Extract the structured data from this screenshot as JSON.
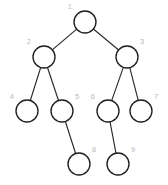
{
  "figure": {
    "type": "node-link-diagram",
    "canvas": {
      "width": 168,
      "height": 185,
      "background": "#ffffff"
    },
    "style": {
      "node_fill": "#ffffff",
      "node_stroke": "#1f1f1f",
      "node_radius": 11,
      "edge_color": "#2b2b2b",
      "label_color": "#b9b9b9",
      "label_font_size": 7.5
    },
    "nodes": [
      {
        "id": "1",
        "label": "1",
        "cx": 85,
        "cy": 22,
        "r": 11,
        "label_x": 72,
        "label_y": 7,
        "label_side": "left"
      },
      {
        "id": "2",
        "label": "2",
        "cx": 44,
        "cy": 57,
        "r": 11,
        "label_x": 31,
        "label_y": 42,
        "label_side": "left"
      },
      {
        "id": "3",
        "label": "3",
        "cx": 127,
        "cy": 57,
        "r": 11,
        "label_x": 140,
        "label_y": 42,
        "label_side": "right"
      },
      {
        "id": "4",
        "label": "4",
        "cx": 27,
        "cy": 111,
        "r": 11,
        "label_x": 14,
        "label_y": 97,
        "label_side": "left"
      },
      {
        "id": "5",
        "label": "5",
        "cx": 62,
        "cy": 111,
        "r": 11,
        "label_x": 75,
        "label_y": 97,
        "label_side": "right"
      },
      {
        "id": "6",
        "label": "6",
        "cx": 108,
        "cy": 111,
        "r": 11,
        "label_x": 95,
        "label_y": 97,
        "label_side": "left"
      },
      {
        "id": "7",
        "label": "7",
        "cx": 141,
        "cy": 111,
        "r": 11,
        "label_x": 154,
        "label_y": 97,
        "label_side": "right"
      },
      {
        "id": "8",
        "label": "8",
        "cx": 79,
        "cy": 164,
        "r": 11,
        "label_x": 92,
        "label_y": 150,
        "label_side": "right"
      },
      {
        "id": "9",
        "label": "9",
        "cx": 118,
        "cy": 164,
        "r": 11,
        "label_x": 131,
        "label_y": 150,
        "label_side": "right"
      }
    ],
    "edges": [
      {
        "from": "1",
        "to": "2"
      },
      {
        "from": "1",
        "to": "3"
      },
      {
        "from": "2",
        "to": "4"
      },
      {
        "from": "2",
        "to": "5"
      },
      {
        "from": "3",
        "to": "6"
      },
      {
        "from": "3",
        "to": "7"
      },
      {
        "from": "5",
        "to": "8"
      },
      {
        "from": "6",
        "to": "9"
      }
    ]
  }
}
